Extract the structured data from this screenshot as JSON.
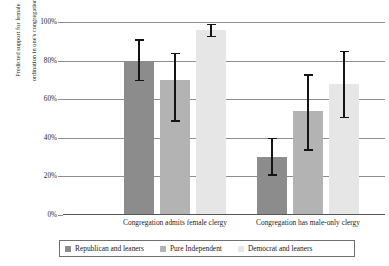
{
  "chart_data": {
    "type": "bar",
    "title": "",
    "subtitle": "",
    "xlabel": "",
    "ylabel": "Predicted support for female ordination in one's congregation",
    "ylabel_line1": "Predicted support for female",
    "ylabel_line2": "ordination in one's congregation",
    "ylim": [
      0,
      100
    ],
    "yunit": "%",
    "grid": true,
    "grid_axis": "y",
    "legend_position": "bottom",
    "categories": [
      "Congregation admits female clergy",
      "Congregation has male-only clergy"
    ],
    "ytick_labels": [
      "0%",
      "20%",
      "40%",
      "60%",
      "80%",
      "100%"
    ],
    "ytick_values": [
      0,
      20,
      40,
      60,
      80,
      100
    ],
    "series": [
      {
        "name": "Republican and leaners",
        "color": "#8c8c8c",
        "values": [
          80,
          30
        ],
        "ci_low": [
          70,
          21
        ],
        "ci_high": [
          91,
          40
        ]
      },
      {
        "name": "Pure Independent",
        "color": "#b3b3b3",
        "values": [
          70,
          54
        ],
        "ci_low": [
          49,
          34
        ],
        "ci_high": [
          84,
          73
        ]
      },
      {
        "name": "Democrat and leaners",
        "color": "#e6e6e6",
        "values": [
          96,
          68
        ],
        "ci_low": [
          93,
          51
        ],
        "ci_high": [
          99,
          85
        ]
      }
    ]
  },
  "legend": {
    "items": [
      {
        "label": "Republican and leaners",
        "color": "#8c8c8c"
      },
      {
        "label": "Pure Independent",
        "color": "#b3b3b3"
      },
      {
        "label": "Democrat and leaners",
        "color": "#e6e6e6"
      }
    ]
  }
}
